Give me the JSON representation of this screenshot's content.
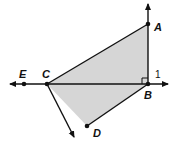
{
  "diagram": {
    "type": "geometry",
    "points": {
      "A": {
        "label": "A",
        "x": 148,
        "y": 24
      },
      "B": {
        "label": "B",
        "x": 148,
        "y": 84
      },
      "C": {
        "label": "C",
        "x": 47,
        "y": 84
      },
      "D": {
        "label": "D",
        "x": 87,
        "y": 126
      },
      "E": {
        "label": "E",
        "x": 24,
        "y": 84
      }
    },
    "angle_label": "1",
    "shaded_fill": "#d6d6d6",
    "line_color": "#111111",
    "right_angle_at": "B"
  }
}
